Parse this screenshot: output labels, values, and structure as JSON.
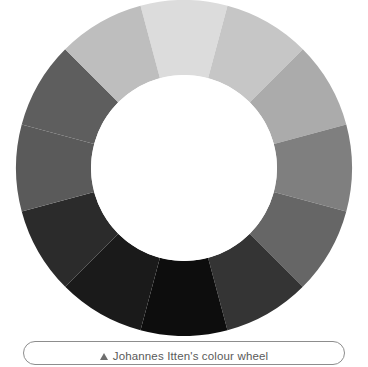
{
  "figure": {
    "caption_marker_icon": "triangle-up-icon",
    "caption_text": "Johannes Itten's colour wheel",
    "background_color": "#ffffff",
    "caption_border_color": "#8d8d8d",
    "caption_text_color": "#5a5a5a"
  },
  "chart_data": {
    "type": "pie",
    "title": "Johannes Itten's colour wheel",
    "subtype": "donut",
    "note": "Reproduction printed in greyscale; the twelve hues appear as tones of grey.",
    "center_x": 184,
    "center_y": 168,
    "outer_radius": 168,
    "inner_radius": 93,
    "segment_count": 12,
    "segment_angle_deg": 30,
    "start_angle_deg": -15,
    "hole_color": "#ffffff",
    "categories": [
      "Yellow",
      "Yellow-orange",
      "Orange",
      "Red-orange",
      "Red",
      "Red-violet",
      "Violet",
      "Blue-violet",
      "Blue",
      "Blue-green",
      "Green",
      "Yellow-green"
    ],
    "values": [
      30,
      30,
      30,
      30,
      30,
      30,
      30,
      30,
      30,
      30,
      30,
      30
    ],
    "colors": [
      "#dcdcdc",
      "#c6c6c6",
      "#ababab",
      "#7f7f7f",
      "#666666",
      "#343434",
      "#0d0d0d",
      "#1a1a1a",
      "#2b2b2b",
      "#5a5a5a",
      "#5e5e5e",
      "#bebebe"
    ],
    "legend": "none",
    "grid": false,
    "xlabel": "",
    "ylabel": ""
  }
}
